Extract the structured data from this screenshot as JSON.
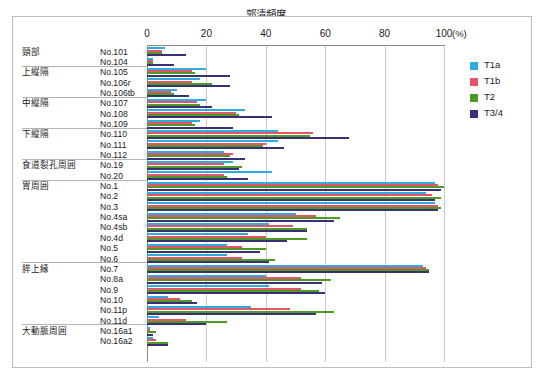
{
  "chart_data": {
    "type": "bar",
    "orientation": "horizontal",
    "title": "郭清頻度",
    "xlabel": "(%)",
    "ylabel": "",
    "xlim": [
      0,
      100
    ],
    "xticks": [
      0,
      20,
      40,
      60,
      80,
      100
    ],
    "grid": true,
    "legend_position": "right",
    "series": [
      {
        "name": "T1a",
        "color": "#2aade3"
      },
      {
        "name": "T1b",
        "color": "#e8536b"
      },
      {
        "name": "T2",
        "color": "#4f9b21"
      },
      {
        "name": "T3/4",
        "color": "#3b2f78"
      }
    ],
    "groups": [
      {
        "label": "頸部",
        "rows": [
          {
            "node": "No.101",
            "values": {
              "T1a": 6,
              "T1b": 5,
              "T2": 5,
              "T3/4": 13
            }
          },
          {
            "node": "No.104",
            "values": {
              "T1a": 2,
              "T1b": 2,
              "T2": 2,
              "T3/4": 9
            }
          }
        ]
      },
      {
        "label": "上縦隔",
        "rows": [
          {
            "node": "No.105",
            "values": {
              "T1a": 20,
              "T1b": 15,
              "T2": 16,
              "T3/4": 28
            }
          },
          {
            "node": "No.106r",
            "values": {
              "T1a": 18,
              "T1b": 15,
              "T2": 22,
              "T3/4": 28
            }
          },
          {
            "node": "No.106tb",
            "values": {
              "T1a": 10,
              "T1b": 8,
              "T2": 9,
              "T3/4": 14
            }
          }
        ]
      },
      {
        "label": "中縦隔",
        "rows": [
          {
            "node": "No.107",
            "values": {
              "T1a": 20,
              "T1b": 17,
              "T2": 18,
              "T3/4": 22
            }
          },
          {
            "node": "No.108",
            "values": {
              "T1a": 33,
              "T1b": 30,
              "T2": 31,
              "T3/4": 42
            }
          },
          {
            "node": "No.109",
            "values": {
              "T1a": 18,
              "T1b": 15,
              "T2": 16,
              "T3/4": 29
            }
          }
        ]
      },
      {
        "label": "下縦隔",
        "rows": [
          {
            "node": "No.110",
            "values": {
              "T1a": 44,
              "T1b": 56,
              "T2": 55,
              "T3/4": 68
            }
          },
          {
            "node": "No.111",
            "values": {
              "T1a": 44,
              "T1b": 40,
              "T2": 39,
              "T3/4": 46
            }
          },
          {
            "node": "No.112",
            "values": {
              "T1a": 26,
              "T1b": 29,
              "T2": 28,
              "T3/4": 33
            }
          }
        ]
      },
      {
        "label": "食道裂孔周囲",
        "rows": [
          {
            "node": "No.19",
            "values": {
              "T1a": 29,
              "T1b": 26,
              "T2": 32,
              "T3/4": 31
            }
          },
          {
            "node": "No.20",
            "values": {
              "T1a": 42,
              "T1b": 26,
              "T2": 27,
              "T3/4": 34
            }
          }
        ]
      },
      {
        "label": "胃周囲",
        "rows": [
          {
            "node": "No.1",
            "values": {
              "T1a": 97,
              "T1b": 98,
              "T2": 100,
              "T3/4": 99
            }
          },
          {
            "node": "No.2",
            "values": {
              "T1a": 94,
              "T1b": 96,
              "T2": 99,
              "T3/4": 97
            }
          },
          {
            "node": "No.3",
            "values": {
              "T1a": 97,
              "T1b": 98,
              "T2": 99,
              "T3/4": 98
            }
          },
          {
            "node": "No.4sa",
            "values": {
              "T1a": 50,
              "T1b": 57,
              "T2": 65,
              "T3/4": 63
            }
          },
          {
            "node": "No.4sb",
            "values": {
              "T1a": 41,
              "T1b": 49,
              "T2": 54,
              "T3/4": 54
            }
          },
          {
            "node": "No.4d",
            "values": {
              "T1a": 34,
              "T1b": 40,
              "T2": 54,
              "T3/4": 47
            }
          },
          {
            "node": "No.5",
            "values": {
              "T1a": 27,
              "T1b": 32,
              "T2": 40,
              "T3/4": 38
            }
          },
          {
            "node": "No.6",
            "values": {
              "T1a": 27,
              "T1b": 32,
              "T2": 43,
              "T3/4": 41
            }
          }
        ]
      },
      {
        "label": "膵上縁",
        "rows": [
          {
            "node": "No.7",
            "values": {
              "T1a": 93,
              "T1b": 94,
              "T2": 95,
              "T3/4": 95
            }
          },
          {
            "node": "No.8a",
            "values": {
              "T1a": 40,
              "T1b": 52,
              "T2": 62,
              "T3/4": 59
            }
          },
          {
            "node": "No.9",
            "values": {
              "T1a": 41,
              "T1b": 52,
              "T2": 58,
              "T3/4": 60
            }
          },
          {
            "node": "No.10",
            "values": {
              "T1a": 7,
              "T1b": 11,
              "T2": 15,
              "T3/4": 17
            }
          },
          {
            "node": "No.11p",
            "values": {
              "T1a": 35,
              "T1b": 48,
              "T2": 63,
              "T3/4": 57
            }
          },
          {
            "node": "No.11d",
            "values": {
              "T1a": 4,
              "T1b": 13,
              "T2": 27,
              "T3/4": 20
            }
          }
        ]
      },
      {
        "label": "大動脈周囲",
        "rows": [
          {
            "node": "No.16a1",
            "values": {
              "T1a": 1,
              "T1b": 1,
              "T2": 3,
              "T3/4": 2
            }
          },
          {
            "node": "No.16a2",
            "values": {
              "T1a": 2,
              "T1b": 3,
              "T2": 7,
              "T3/4": 7
            }
          }
        ]
      }
    ]
  },
  "legend": {
    "items": [
      {
        "label": "T1a",
        "color": "#2aade3"
      },
      {
        "label": "T1b",
        "color": "#e8536b"
      },
      {
        "label": "T2",
        "color": "#4f9b21"
      },
      {
        "label": "T3/4",
        "color": "#3b2f78"
      }
    ]
  },
  "axis": {
    "unit": "(%)",
    "ticks": [
      "0",
      "20",
      "40",
      "60",
      "80",
      "100"
    ]
  }
}
